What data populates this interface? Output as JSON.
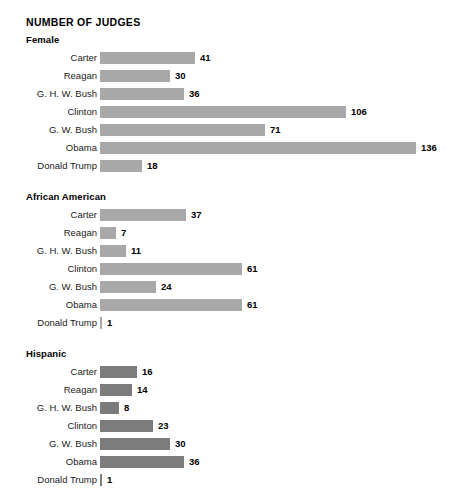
{
  "chart_data": {
    "type": "bar",
    "orientation": "horizontal",
    "title": "NUMBER OF JUDGES",
    "xlabel": "",
    "ylabel": "",
    "grid": false,
    "legend": false,
    "axis_visible": false,
    "value_labels": true,
    "categories": [
      "Carter",
      "Reagan",
      "G. H. W. Bush",
      "Clinton",
      "G. W. Bush",
      "Obama",
      "Donald Trump"
    ],
    "px_per_unit": 2.32,
    "colors": {
      "light_bar": "#a8a8a8",
      "dark_bar": "#7c7c7c",
      "text": "#1a1a1a",
      "background": "#ffffff"
    },
    "panels": [
      {
        "title": "Female",
        "bar_color": "#a8a8a8",
        "values": [
          41,
          30,
          36,
          106,
          71,
          136,
          18
        ]
      },
      {
        "title": "African American",
        "bar_color": "#a8a8a8",
        "values": [
          37,
          7,
          11,
          61,
          24,
          61,
          1
        ]
      },
      {
        "title": "Hispanic",
        "bar_color": "#7c7c7c",
        "values": [
          16,
          14,
          8,
          23,
          30,
          36,
          1
        ]
      }
    ]
  }
}
